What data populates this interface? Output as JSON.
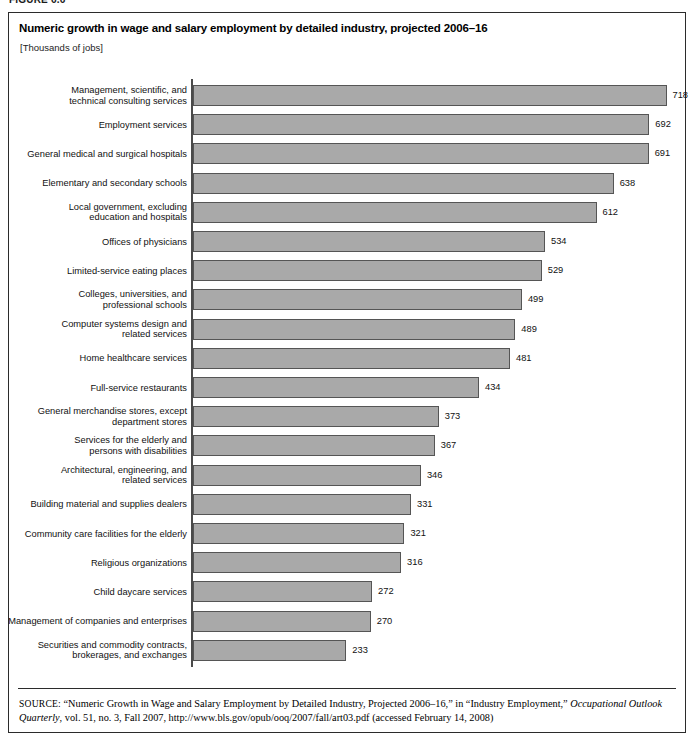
{
  "figure": {
    "caption": "FIGURE 6.6"
  },
  "header": {
    "title": "Numeric growth in wage and salary employment by detailed industry, projected 2006–16",
    "subtitle": "[Thousands of jobs]"
  },
  "source": {
    "kicker": "SOURCE:",
    "text_part1": " “Numeric Growth in Wage and Salary Employment by Detailed Industry, Projected 2006–16,” in “Industry Employment,” ",
    "italic1": "Occupational Outlook Quarterly",
    "text_part2": ", vol. 51, no. 3, Fall 2007, http://www.bls.gov/opub/ooq/2007/fall/art03.pdf (accessed February 14, 2008)"
  },
  "colors": {
    "bar_fill": "#a9a9a9",
    "bar_border": "#555555",
    "axis": "#4a4a4a",
    "frame": "#2b2b2b",
    "text": "#111111"
  },
  "chart_data": {
    "type": "bar",
    "orientation": "horizontal",
    "title": "Numeric growth in wage and salary employment by detailed industry, projected 2006–16",
    "subtitle": "[Thousands of jobs]",
    "xlabel": "",
    "ylabel": "",
    "units": "Thousands of jobs",
    "grid": false,
    "legend": "none",
    "xlim": [
      0,
      718
    ],
    "categories": [
      "Management, scientific, and\ntechnical consulting services",
      "Employment services",
      "General medical and surgical hospitals",
      "Elementary and secondary schools",
      "Local government, excluding\neducation and hospitals",
      "Offices of physicians",
      "Limited-service eating places",
      "Colleges, universities, and\nprofessional schools",
      "Computer systems design and\nrelated services",
      "Home healthcare services",
      "Full-service restaurants",
      "General merchandise stores, except\ndepartment stores",
      "Services for the elderly and\npersons with disabilities",
      "Architectural, engineering, and\nrelated services",
      "Building material and supplies dealers",
      "Community care facilities for the elderly",
      "Religious organizations",
      "Child daycare services",
      "Management of companies and enterprises",
      "Securities and commodity contracts,\nbrokerages, and exchanges"
    ],
    "values": [
      718,
      692,
      691,
      638,
      612,
      534,
      529,
      499,
      489,
      481,
      434,
      373,
      367,
      346,
      331,
      321,
      316,
      272,
      270,
      233
    ]
  }
}
